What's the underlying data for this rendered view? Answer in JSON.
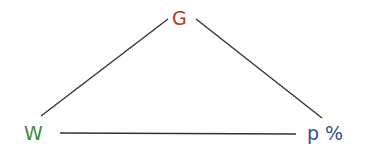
{
  "diagram": {
    "nodes": {
      "G": {
        "label": "G",
        "color": "#b23a2a"
      },
      "W": {
        "label": "W",
        "color": "#3a8a3a"
      },
      "P": {
        "label": "p %",
        "color": "#2f4f8f"
      }
    },
    "edges": [
      {
        "from": "W",
        "to": "G"
      },
      {
        "from": "G",
        "to": "P"
      },
      {
        "from": "W",
        "to": "P"
      }
    ],
    "line_color": "#333333"
  }
}
